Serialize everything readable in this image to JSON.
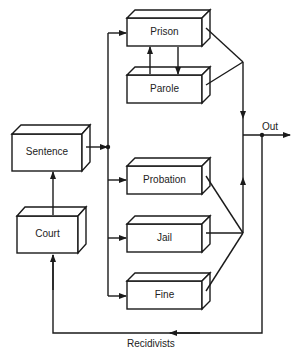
{
  "diagram": {
    "type": "flowchart",
    "nodes": {
      "sentence": {
        "label": "Sentence"
      },
      "court": {
        "label": "Court"
      },
      "prison": {
        "label": "Prison"
      },
      "parole": {
        "label": "Parole"
      },
      "probation": {
        "label": "Probation"
      },
      "jail": {
        "label": "Jail"
      },
      "fine": {
        "label": "Fine"
      }
    },
    "edge_labels": {
      "out": "Out",
      "recidivists": "Recidivists"
    },
    "edges": [
      {
        "from": "Court",
        "to": "Sentence"
      },
      {
        "from": "Sentence",
        "to": "Prison"
      },
      {
        "from": "Sentence",
        "to": "Probation"
      },
      {
        "from": "Sentence",
        "to": "Jail"
      },
      {
        "from": "Sentence",
        "to": "Fine"
      },
      {
        "from": "Prison",
        "to": "Parole"
      },
      {
        "from": "Parole",
        "to": "Prison"
      },
      {
        "from": "Prison",
        "to": "Out"
      },
      {
        "from": "Parole",
        "to": "Out"
      },
      {
        "from": "Probation",
        "to": "Out"
      },
      {
        "from": "Jail",
        "to": "Out"
      },
      {
        "from": "Fine",
        "to": "Out"
      },
      {
        "from": "Out",
        "to": "Court",
        "label": "Recidivists"
      }
    ],
    "colors": {
      "stroke": "#1a1a1a",
      "background": "#ffffff"
    }
  }
}
